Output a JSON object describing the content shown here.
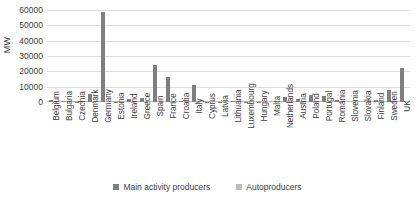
{
  "chart_data": {
    "type": "bar",
    "title": "",
    "xlabel": "",
    "ylabel": "MW",
    "ylim": [
      0,
      60000
    ],
    "yticks": [
      0,
      10000,
      20000,
      30000,
      40000,
      50000,
      60000
    ],
    "ytick_labels": [
      "0",
      "10000",
      "20000",
      "30000",
      "40000",
      "50000",
      "60000"
    ],
    "grid": true,
    "legend_position": "bottom",
    "categories": [
      "Belgium",
      "Bulgaria",
      "Czechia",
      "Denmark",
      "Germany",
      "Estonia",
      "Ireland",
      "Greece",
      "Spain",
      "France",
      "Croatia",
      "Italy",
      "Cyprus",
      "Latvia",
      "Lithuania",
      "Luxembourg",
      "Hungary",
      "Malta",
      "Netherlands",
      "Austria",
      "Poland",
      "Portugal",
      "Romania",
      "Slovenia",
      "Slovakia",
      "Finland",
      "Sweden",
      "UK"
    ],
    "series": [
      {
        "name": "Main activity producers",
        "color": "#7f7f7f",
        "values": [
          1500,
          700,
          200,
          5000,
          59000,
          300,
          2000,
          2400,
          24000,
          16000,
          400,
          11000,
          150,
          60,
          450,
          100,
          300,
          0,
          3000,
          2000,
          4500,
          4000,
          1500,
          0,
          0,
          1500,
          8000,
          22000
        ]
      },
      {
        "name": "Autoproducers",
        "color": "#bfbfbf",
        "values": [
          120,
          40,
          60,
          150,
          600,
          30,
          80,
          60,
          400,
          250,
          20,
          300,
          10,
          10,
          20,
          10,
          20,
          0,
          200,
          150,
          200,
          120,
          80,
          20,
          20,
          100,
          200,
          500
        ]
      }
    ]
  },
  "legend": {
    "items": [
      {
        "label": "Main activity producers"
      },
      {
        "label": "Autoproducers"
      }
    ]
  }
}
